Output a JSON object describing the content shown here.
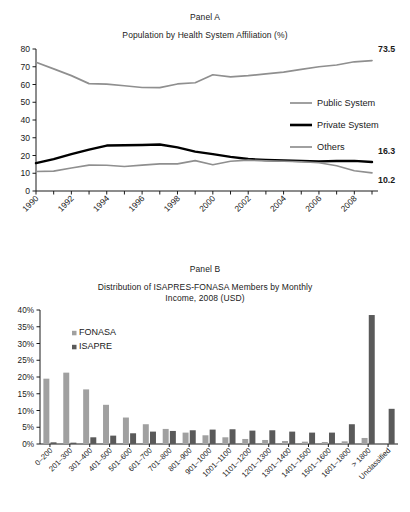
{
  "panel_a": {
    "label": "Panel A",
    "subtitle": "Population by Health System Affiliation (%)",
    "legend": [
      {
        "name": "Public System",
        "color": "#8f8f8f"
      },
      {
        "name": "Private System",
        "color": "#000000"
      },
      {
        "name": "Others",
        "color": "#8f8f8f"
      }
    ],
    "end_labels": {
      "public": "73.5",
      "private": "16.3",
      "others": "10.2"
    }
  },
  "panel_b": {
    "label": "Panel B",
    "subtitle_line1": "Distribution of ISAPRES-FONASA Members by Monthly",
    "subtitle_line2": "Income, 2008 (USD)",
    "legend": [
      {
        "name": "FONASA",
        "color": "#a0a0a0"
      },
      {
        "name": "ISAPRE",
        "color": "#5a5a5a"
      }
    ]
  },
  "chart_data": [
    {
      "type": "line",
      "title": "Population by Health System Affiliation (%)",
      "subtitle": "Panel A",
      "xlabel": "",
      "ylabel": "",
      "ylim": [
        0,
        80
      ],
      "yticks": [
        0,
        10,
        20,
        30,
        40,
        50,
        60,
        70,
        80
      ],
      "xticks": [
        1990,
        1992,
        1994,
        1996,
        1998,
        2000,
        2002,
        2004,
        2006,
        2008
      ],
      "x": [
        1990,
        1991,
        1992,
        1993,
        1994,
        1995,
        1996,
        1997,
        1998,
        1999,
        2000,
        2001,
        2002,
        2003,
        2004,
        2005,
        2006,
        2007,
        2008,
        2009
      ],
      "grid": false,
      "legend_position": "right-middle",
      "series": [
        {
          "name": "Public System",
          "color": "#8f8f8f",
          "values": [
            72.5,
            68.8,
            65.0,
            60.5,
            60.2,
            59.3,
            58.3,
            58.2,
            60.3,
            61.0,
            65.5,
            64.3,
            65.0,
            66.0,
            67.0,
            68.5,
            70.0,
            71.0,
            72.8,
            73.5
          ]
        },
        {
          "name": "Private System",
          "color": "#000000",
          "values": [
            15.7,
            18.0,
            20.8,
            23.3,
            25.6,
            25.8,
            25.9,
            26.2,
            24.6,
            22.2,
            20.8,
            19.2,
            18.0,
            17.5,
            17.2,
            16.9,
            16.7,
            16.9,
            17.0,
            16.3
          ]
        },
        {
          "name": "Others",
          "color": "#8f8f8f",
          "values": [
            11.0,
            11.2,
            13.0,
            14.6,
            14.5,
            13.8,
            14.6,
            15.3,
            15.3,
            17.1,
            14.8,
            16.8,
            17.4,
            17.0,
            16.8,
            16.5,
            15.9,
            14.2,
            11.4,
            10.2
          ]
        }
      ],
      "annotations": [
        {
          "text": "73.5",
          "series": "Public System",
          "x": 2009
        },
        {
          "text": "16.3",
          "series": "Private System",
          "x": 2009
        },
        {
          "text": "10.2",
          "series": "Others",
          "x": 2009
        }
      ]
    },
    {
      "type": "bar",
      "title": "Distribution of ISAPRES-FONASA Members by Monthly Income, 2008 (USD)",
      "subtitle": "Panel B",
      "xlabel": "",
      "ylabel": "",
      "ylim": [
        0,
        40
      ],
      "yticks": [
        0,
        5,
        10,
        15,
        20,
        25,
        30,
        35,
        40
      ],
      "ytick_labels": [
        "0%",
        "5%",
        "10%",
        "15%",
        "20%",
        "25%",
        "30%",
        "35%",
        "40%"
      ],
      "grid": false,
      "legend_position": "top-left",
      "categories": [
        "0–200",
        "201–300",
        "301–400",
        "401–500",
        "501–600",
        "601–700",
        "701–800",
        "801–900",
        "901–1000",
        "1001–1100",
        "1101–1200",
        "1201–1300",
        "1301–1400",
        "1401–1500",
        "1501–1600",
        "1601–1800",
        "> 1800",
        "Unclassified"
      ],
      "series": [
        {
          "name": "FONASA",
          "color": "#a0a0a0",
          "values": [
            19.5,
            21.3,
            16.3,
            11.7,
            7.9,
            5.9,
            4.5,
            3.4,
            2.6,
            2.0,
            1.5,
            1.2,
            0.9,
            0.7,
            0.6,
            0.8,
            1.8,
            0.0
          ]
        },
        {
          "name": "ISAPRE",
          "color": "#5a5a5a",
          "values": [
            0.5,
            0.4,
            2.0,
            2.5,
            3.2,
            3.7,
            3.9,
            4.1,
            4.3,
            4.4,
            4.0,
            4.1,
            3.7,
            3.4,
            3.4,
            5.9,
            38.5,
            10.5
          ]
        }
      ]
    }
  ]
}
